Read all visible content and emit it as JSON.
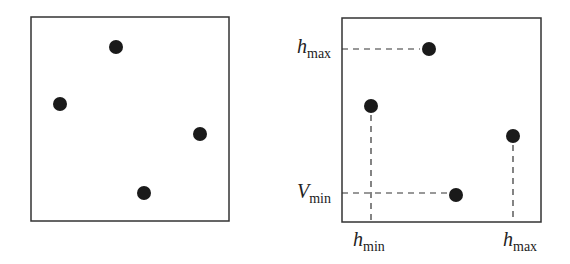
{
  "left_panel": {
    "box": {
      "x": 31,
      "y": 17,
      "w": 198,
      "h": 204
    },
    "points": [
      {
        "x": 116,
        "y": 47
      },
      {
        "x": 60,
        "y": 104
      },
      {
        "x": 200,
        "y": 134
      },
      {
        "x": 144,
        "y": 193
      }
    ]
  },
  "right_panel": {
    "box": {
      "x": 342,
      "y": 18,
      "w": 199,
      "h": 204
    },
    "points": [
      {
        "x": 429,
        "y": 49
      },
      {
        "x": 371,
        "y": 106
      },
      {
        "x": 513,
        "y": 136
      },
      {
        "x": 456,
        "y": 195
      }
    ],
    "labels": {
      "h_max_left": {
        "main": "h",
        "sub": "max"
      },
      "v_min_left": {
        "main": "V",
        "sub": "min"
      },
      "h_min_bottom": {
        "main": "h",
        "sub": "min"
      },
      "h_max_bottom": {
        "main": "h",
        "sub": "max"
      }
    }
  },
  "colors": {
    "stroke": "#333333",
    "point": "#1a1a1a"
  }
}
